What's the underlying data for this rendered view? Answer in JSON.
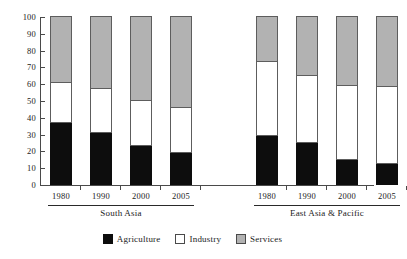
{
  "chart_data": {
    "type": "bar",
    "subtype": "stacked-bar",
    "title": "",
    "xlabel": "",
    "ylabel": "",
    "ylim": [
      0,
      100
    ],
    "ytick_labels": [
      "0",
      "10",
      "20",
      "30",
      "40",
      "50",
      "60",
      "70",
      "80",
      "90",
      "100"
    ],
    "ytick_values": [
      0,
      10,
      20,
      30,
      40,
      50,
      60,
      70,
      80,
      90,
      100
    ],
    "grid": false,
    "legend_position": "bottom",
    "categories": [
      "1980",
      "1990",
      "2000",
      "2005",
      "1980",
      "1990",
      "2000",
      "2005"
    ],
    "groups": [
      {
        "name": "South Asia",
        "categories": [
          "1980",
          "1990",
          "2000",
          "2005"
        ]
      },
      {
        "name": "East Asia & Pacific",
        "categories": [
          "1980",
          "1990",
          "2000",
          "2005"
        ]
      }
    ],
    "series": [
      {
        "name": "Agriculture",
        "color": "#0d0d0d",
        "values": [
          37,
          31,
          23,
          19,
          29,
          25,
          15,
          12.5
        ]
      },
      {
        "name": "Industry",
        "color": "#ffffff",
        "values": [
          24,
          26,
          27,
          27,
          44,
          40,
          44,
          46
        ]
      },
      {
        "name": "Services",
        "color": "#b2b2b2",
        "values": [
          39,
          43,
          50,
          54,
          27,
          35,
          41,
          41.5
        ]
      }
    ],
    "cumulative_tops": {
      "agriculture": [
        37,
        31,
        23,
        19,
        29,
        25,
        15,
        12.5
      ],
      "industry": [
        61,
        57,
        50,
        46,
        73,
        65,
        59,
        58.5
      ],
      "services": [
        100,
        100,
        100,
        100,
        100,
        100,
        100,
        100
      ]
    }
  },
  "legend": {
    "items": [
      {
        "label": "Agriculture",
        "swatch": "agriculture"
      },
      {
        "label": "Industry",
        "swatch": "industry"
      },
      {
        "label": "Services",
        "swatch": "services"
      }
    ]
  },
  "colors": {
    "agriculture": "#0d0d0d",
    "industry": "#ffffff",
    "services": "#b2b2b2",
    "axis": "#4a4a4a",
    "background": "#ffffff"
  }
}
